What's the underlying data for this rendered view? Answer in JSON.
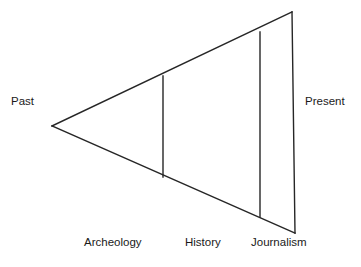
{
  "diagram": {
    "type": "wedge-triangle",
    "stroke_color": "#262626",
    "background_color": "#ffffff",
    "axis_labels": {
      "left": "Past",
      "right": "Present"
    },
    "segment_labels": [
      "Archeology",
      "History",
      "Journalism"
    ],
    "geometry": {
      "apex": [
        52,
        126
      ],
      "top_right": [
        292,
        12
      ],
      "bottom_right": [
        295,
        233
      ],
      "dividers": [
        {
          "name": "archeology-history-divider",
          "x": 163,
          "y_top": 76,
          "y_bottom": 177
        },
        {
          "name": "history-journalism-divider",
          "x": 260,
          "y_top": 32,
          "y_bottom": 217
        }
      ]
    }
  }
}
